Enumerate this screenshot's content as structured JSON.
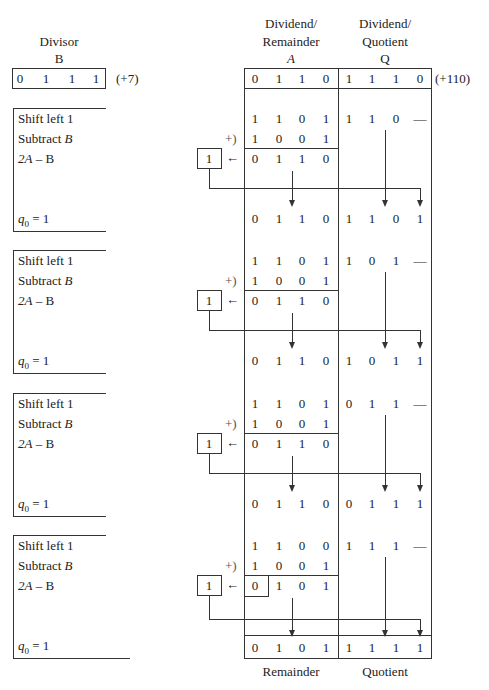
{
  "header": {
    "divisor_title": "Divisor",
    "divisor_reg": "B",
    "a_title_1": "Dividend/",
    "a_title_2": "Remainder",
    "a_reg": "A",
    "q_title_1": "Dividend/",
    "q_title_2": "Quotient",
    "q_reg": "Q"
  },
  "divisor": {
    "bits": [
      "0",
      "1",
      "1",
      "1"
    ],
    "value": "(+7)"
  },
  "initial": {
    "a_bits": [
      "0",
      "1",
      "1",
      "0"
    ],
    "q_bits": [
      "1",
      "1",
      "1",
      "0"
    ],
    "value": "(+110)"
  },
  "labels": {
    "shift": "Shift left 1",
    "subtract": "Subtract ",
    "subtract_var": "B",
    "diff_a": "2A",
    "diff_rest": " – B",
    "q0": "q",
    "q0_sub": "0",
    "q0_val": " = 1",
    "plus": "+)",
    "carry": "1",
    "left_arrow": "←"
  },
  "steps": [
    {
      "shift_a": [
        "1",
        "1",
        "0",
        "1"
      ],
      "shift_q": [
        "1",
        "1",
        "0",
        "—"
      ],
      "neg_b": [
        "1",
        "0",
        "0",
        "1"
      ],
      "diff": [
        "0",
        "1",
        "1",
        "0"
      ],
      "result_a": [
        "0",
        "1",
        "1",
        "0"
      ],
      "result_q": [
        "1",
        "1",
        "0",
        "1"
      ]
    },
    {
      "shift_a": [
        "1",
        "1",
        "0",
        "1"
      ],
      "shift_q": [
        "1",
        "0",
        "1",
        "—"
      ],
      "neg_b": [
        "1",
        "0",
        "0",
        "1"
      ],
      "diff": [
        "0",
        "1",
        "1",
        "0"
      ],
      "result_a": [
        "0",
        "1",
        "1",
        "0"
      ],
      "result_q": [
        "1",
        "0",
        "1",
        "1"
      ]
    },
    {
      "shift_a": [
        "1",
        "1",
        "0",
        "1"
      ],
      "shift_q": [
        "0",
        "1",
        "1",
        "—"
      ],
      "neg_b": [
        "1",
        "0",
        "0",
        "1"
      ],
      "diff": [
        "0",
        "1",
        "1",
        "0"
      ],
      "result_a": [
        "0",
        "1",
        "1",
        "0"
      ],
      "result_q": [
        "0",
        "1",
        "1",
        "1"
      ]
    },
    {
      "shift_a": [
        "1",
        "1",
        "0",
        "0"
      ],
      "shift_q": [
        "1",
        "1",
        "1",
        "—"
      ],
      "neg_b": [
        "1",
        "0",
        "0",
        "1"
      ],
      "diff": [
        "0",
        "1",
        "0",
        "1"
      ],
      "result_a": [
        "0",
        "1",
        "0",
        "1"
      ],
      "result_q": [
        "1",
        "1",
        "1",
        "1"
      ]
    }
  ],
  "footer": {
    "remainder": "Remainder",
    "quotient": "Quotient"
  }
}
